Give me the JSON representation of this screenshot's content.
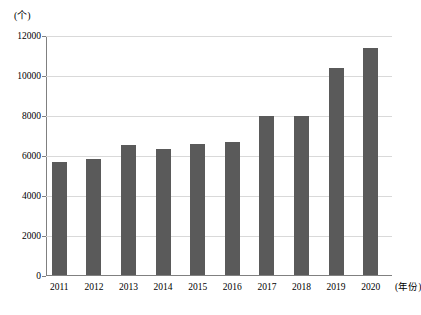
{
  "chart_data": {
    "type": "bar",
    "title": "",
    "xlabel": "(年份)",
    "ylabel": "(个)",
    "categories": [
      "2011",
      "2012",
      "2013",
      "2014",
      "2015",
      "2016",
      "2017",
      "2018",
      "2019",
      "2020"
    ],
    "values": [
      5650,
      5780,
      6520,
      6300,
      6550,
      6650,
      7950,
      7950,
      10350,
      11350
    ],
    "ylim": [
      0,
      12000
    ],
    "yticks": [
      0,
      2000,
      4000,
      6000,
      8000,
      10000,
      12000
    ],
    "ytick_labels": [
      "0",
      "2000",
      "4000",
      "6000",
      "8000",
      "10000",
      "12000"
    ],
    "grid": "horizontal",
    "legend": "none",
    "series": [
      {
        "name": "数量",
        "color": "#5a5a5a",
        "values": [
          5650,
          5780,
          6520,
          6300,
          6550,
          6650,
          7950,
          7950,
          10350,
          11350
        ]
      }
    ],
    "colors": {
      "bar": "#5a5a5a",
      "gridline": "#d9d9d9",
      "axis": "#808080",
      "background": "#ffffff",
      "text": "#000000"
    }
  }
}
